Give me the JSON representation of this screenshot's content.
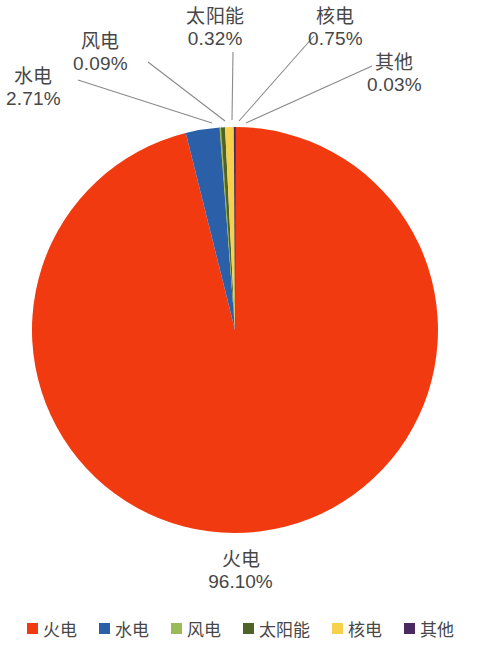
{
  "chart_data": {
    "type": "pie",
    "title": "",
    "categories": [
      "火电",
      "水电",
      "风电",
      "太阳能",
      "核电",
      "其他"
    ],
    "values": [
      96.1,
      2.71,
      0.09,
      0.32,
      0.75,
      0.03
    ],
    "value_labels": [
      "96.10%",
      "0.09%",
      "0.32%",
      "0.75%",
      "0.03%",
      "2.71%"
    ],
    "unit": "%",
    "legend_position": "bottom",
    "grid": false,
    "start_angle_deg": 0,
    "direction": "clockwise",
    "slices": [
      {
        "label": "火电",
        "value": 96.1,
        "value_label": "96.10%",
        "color": "#F23A10"
      },
      {
        "label": "水电",
        "value": 2.71,
        "value_label": "2.71%",
        "color": "#2B5FA8"
      },
      {
        "label": "风电",
        "value": 0.09,
        "value_label": "0.09%",
        "color": "#9BBB59"
      },
      {
        "label": "太阳能",
        "value": 0.32,
        "value_label": "0.32%",
        "color": "#4F6228"
      },
      {
        "label": "核电",
        "value": 0.75,
        "value_label": "0.75%",
        "color": "#F7D14C"
      },
      {
        "label": "其他",
        "value": 0.03,
        "value_label": "0.03%",
        "color": "#4A2960"
      }
    ]
  },
  "callouts": {
    "hydro": {
      "category": "水电",
      "percent": "2.71%"
    },
    "wind": {
      "category": "风电",
      "percent": "0.09%"
    },
    "solar": {
      "category": "太阳能",
      "percent": "0.32%"
    },
    "nuclear": {
      "category": "核电",
      "percent": "0.75%"
    },
    "other": {
      "category": "其他",
      "percent": "0.03%"
    },
    "thermal": {
      "category": "火电",
      "percent": "96.10%"
    }
  },
  "legend": {
    "items": [
      {
        "label": "火电",
        "color": "#F23A10"
      },
      {
        "label": "水电",
        "color": "#2B5FA8"
      },
      {
        "label": "风电",
        "color": "#9BBB59"
      },
      {
        "label": "太阳能",
        "color": "#4F6228"
      },
      {
        "label": "核电",
        "color": "#F7D14C"
      },
      {
        "label": "其他",
        "color": "#4A2960"
      }
    ]
  },
  "geometry": {
    "cx": 235,
    "cy": 330,
    "r": 203
  }
}
